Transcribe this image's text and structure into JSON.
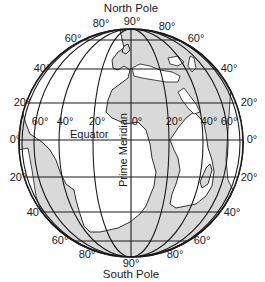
{
  "diagram": {
    "title_top": "North Pole",
    "title_bottom": "South Pole",
    "equator_label": "Equator",
    "prime_meridian_label": "Prime Meridian",
    "colors": {
      "ocean": "#ffffff",
      "land": "#d9d9d9",
      "lines": "#1a1a1a"
    },
    "latitude_labels": {
      "n90": "90°",
      "n80_left": "80°",
      "n80_right": "80°",
      "n60_left": "60°",
      "n60_right": "60°",
      "n40_left": "40°",
      "n40_right": "40°",
      "n20_left": "20°",
      "n20_right": "20°",
      "eq_left": "0°",
      "eq_right": "0°",
      "s20_left": "20°",
      "s20_right": "20°",
      "s40_left": "40°",
      "s40_right": "40°",
      "s60_left": "60°",
      "s60_right": "60°",
      "s80_left": "80°",
      "s80_right": "80°",
      "s90": "90°"
    },
    "longitude_labels": {
      "w60": "60°",
      "w40": "40°",
      "w20": "20°",
      "pm0": "0°",
      "e20": "20°",
      "e40": "40°",
      "e60": "60°"
    }
  }
}
